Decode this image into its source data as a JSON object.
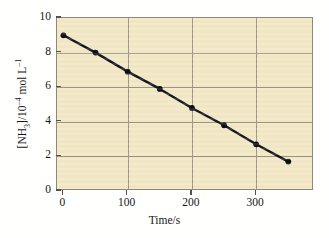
{
  "chart_data": {
    "type": "line",
    "title": "",
    "xlabel": "Time/s",
    "ylabel_parts": {
      "species_open": "[NH",
      "species_sub": "3",
      "species_close": "]/10",
      "exp1": "–4",
      "units": " mol L",
      "exp2": "–1"
    },
    "ylabel_plain": "[NH3]/10-4 mol L-1",
    "x": [
      0,
      50,
      100,
      150,
      200,
      250,
      300,
      350
    ],
    "values": [
      9.0,
      8.0,
      6.9,
      5.9,
      4.8,
      3.8,
      2.7,
      1.7
    ],
    "series": [
      {
        "name": "[NH3] decay",
        "x": [
          0,
          50,
          100,
          150,
          200,
          250,
          300,
          350
        ],
        "values": [
          9.0,
          8.0,
          6.9,
          5.9,
          4.8,
          3.8,
          2.7,
          1.7
        ]
      }
    ],
    "xlim": [
      -10,
      390
    ],
    "ylim": [
      0,
      10
    ],
    "xticks": [
      0,
      100,
      200,
      300
    ],
    "xtick_labels": [
      "0",
      "100",
      "200",
      "300"
    ],
    "yticks": [
      0,
      2,
      4,
      6,
      8,
      10
    ],
    "ytick_labels": [
      "0",
      "2",
      "4",
      "6",
      "8",
      "10"
    ],
    "grid": true,
    "grid_x_values": [
      100,
      200,
      300
    ],
    "grid_y_values": [
      2,
      4,
      6,
      8
    ],
    "legend": null,
    "legend_position": "none",
    "marker": "filled-circle",
    "annotations": []
  },
  "style": {
    "plot_background": "#f2e8c6",
    "page_background": "#ffffff",
    "frame_color": "#8d8878",
    "grid_color": "#9c9583",
    "line_color": "#16161f",
    "marker_color": "#0d0d14",
    "text_color": "#161616"
  }
}
